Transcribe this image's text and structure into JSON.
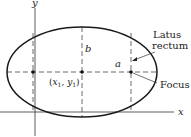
{
  "diagram": {
    "labels": {
      "y_axis": "y",
      "x_axis": "x",
      "semi_minor": "b",
      "semi_major": "a",
      "center_x": "x",
      "center_sub_x": "1",
      "center_sep": ", ",
      "center_y": "y",
      "center_sub_y": "1",
      "latus_line1": "Latus",
      "latus_line2": "rectum",
      "focus": "Focus"
    },
    "colors": {
      "stroke": "#1a1a1a",
      "dash": "#444444",
      "background": "#ffffff"
    }
  }
}
